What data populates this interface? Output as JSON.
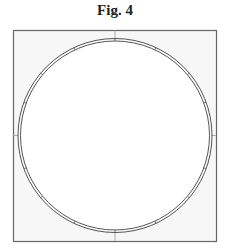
{
  "figure": {
    "title": "Fig. 4",
    "frame": {
      "x": 13,
      "y": 30,
      "width": 203,
      "height": 211,
      "stroke": "#666666",
      "fill": "#f7f7f7"
    },
    "ring": {
      "cx": 115,
      "cy": 135.5,
      "r_outer": 97,
      "r_inner": 94.5,
      "stroke": "#555555",
      "fill": "#ffffff"
    },
    "crosshair_color": "#999999",
    "segment_marks_deg": [
      -70,
      -50,
      -25,
      0,
      25,
      50,
      70,
      110,
      130,
      155,
      180,
      205,
      230,
      250
    ]
  }
}
